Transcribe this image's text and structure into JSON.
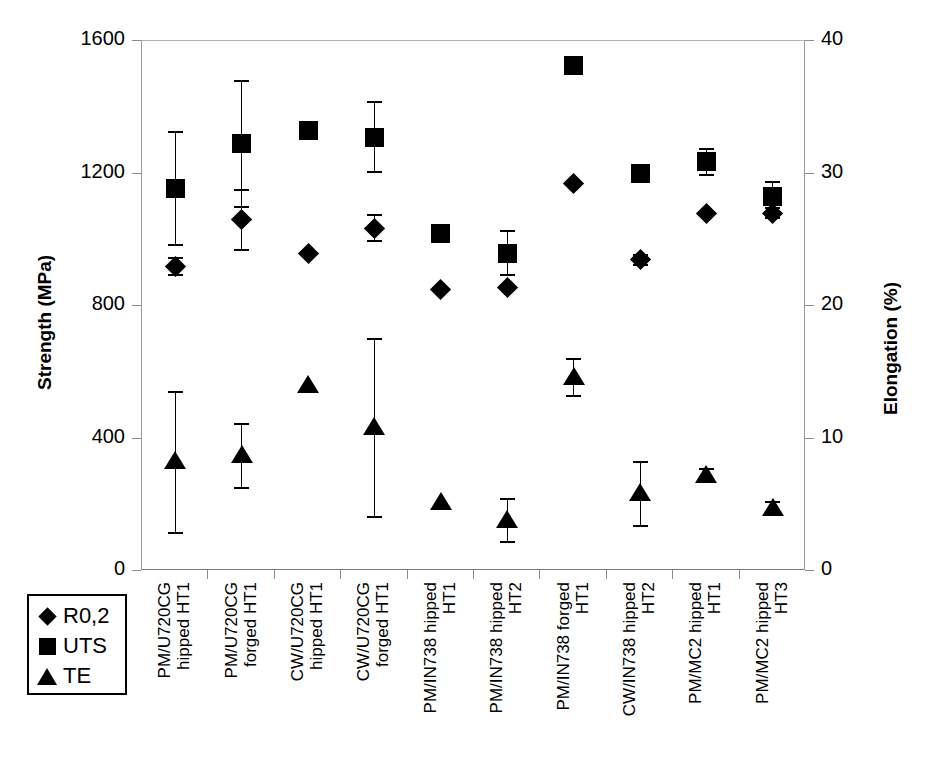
{
  "chart_data": {
    "type": "scatter",
    "title": "",
    "ylabel": "Strength (MPa)",
    "y2label": "Elongation (%)",
    "xlabel": "",
    "ylim": [
      0,
      1600
    ],
    "y2lim": [
      0,
      40
    ],
    "yticks": [
      "0",
      "400",
      "800",
      "1200",
      "1600"
    ],
    "ytick_values": [
      0,
      400,
      800,
      1200,
      1600
    ],
    "y2ticks": [
      "0",
      "10",
      "20",
      "30",
      "40"
    ],
    "y2tick_values": [
      0,
      10,
      20,
      30,
      40
    ],
    "grid": false,
    "legend_position": "below-left",
    "categories": [
      "PM/U720CG\nhipped HT1",
      "PM/U720CG\nforged HT1",
      "CW/U720CG\nhipped HT1",
      "CW/U720CG\nforged HT1",
      "PM/IN738 hipped\nHT1",
      "PM/IN738 hipped\nHT2",
      "PM/IN738 forged\nHT1",
      "CW/IN738 hipped\nHT2",
      "PM/MC2 hipped\nHT1",
      "PM/MC2 hipped\nHT3"
    ],
    "series": [
      {
        "name": "R0,2",
        "marker": "diamond",
        "axis": "left",
        "unit": "MPa",
        "values": [
          920,
          1060,
          960,
          1035,
          850,
          855,
          1170,
          940,
          1080,
          1080
        ],
        "errors": [
          25,
          90,
          0,
          40,
          0,
          0,
          0,
          15,
          0,
          15
        ]
      },
      {
        "name": "UTS",
        "marker": "square",
        "axis": "left",
        "unit": "MPa",
        "values": [
          1155,
          1290,
          1330,
          1310,
          1020,
          960,
          1525,
          1200,
          1235,
          1130
        ],
        "errors": [
          170,
          190,
          0,
          105,
          0,
          65,
          0,
          0,
          40,
          45
        ]
      },
      {
        "name": "TE",
        "marker": "triangle",
        "axis": "right",
        "unit": "%",
        "values": [
          8.2,
          8.7,
          14.0,
          10.8,
          5.1,
          3.8,
          14.6,
          5.8,
          7.2,
          4.7
        ],
        "errors": [
          5.3,
          2.4,
          0,
          6.7,
          0,
          1.6,
          1.4,
          2.4,
          0.5,
          0.5
        ]
      }
    ]
  },
  "legend": {
    "items": [
      {
        "label": "R0,2",
        "marker": "diamond"
      },
      {
        "label": "UTS",
        "marker": "square"
      },
      {
        "label": "TE",
        "marker": "triangle"
      }
    ]
  },
  "colors": {
    "marker": "#000000",
    "axis": "#8b8b8b",
    "background": "#ffffff"
  }
}
